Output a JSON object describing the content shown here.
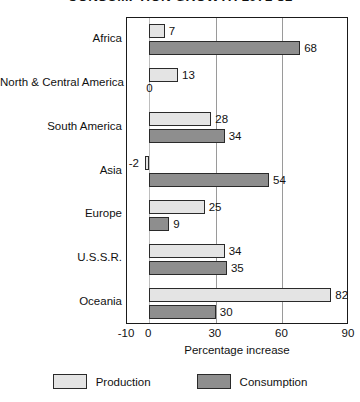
{
  "chart_data": {
    "type": "bar",
    "orientation": "horizontal",
    "title": "CONSUMPTION GROWTH 1971-81",
    "xlabel": "Percentage increase",
    "ylabel": "",
    "xlim": [
      -10,
      90
    ],
    "xticks": [
      -10,
      0,
      30,
      60,
      90
    ],
    "xticklabels": [
      "-10",
      "0",
      "30",
      "60",
      "90"
    ],
    "gridlines_x": [
      30,
      60
    ],
    "grid": true,
    "legend_position": "bottom",
    "categories": [
      "Africa",
      "North & Central America",
      "South America",
      "Asia",
      "Europe",
      "U.S.S.R.",
      "Oceania"
    ],
    "series": [
      {
        "name": "Production",
        "color": "#e4e4e4",
        "values": [
          7,
          13,
          28,
          -2,
          25,
          34,
          82
        ]
      },
      {
        "name": "Consumption",
        "color": "#8e8e8e",
        "values": [
          68,
          0,
          34,
          54,
          9,
          35,
          30
        ]
      }
    ],
    "value_labels": {
      "Africa": {
        "production": "7",
        "consumption": "68"
      },
      "North & Central America": {
        "production": "13",
        "consumption": "0"
      },
      "South America": {
        "production": "28",
        "consumption": "34"
      },
      "Asia": {
        "production": "-2",
        "consumption": "54"
      },
      "Europe": {
        "production": "25",
        "consumption": "9"
      },
      "U.S.S.R.": {
        "production": "34",
        "consumption": "35"
      },
      "Oceania": {
        "production": "82",
        "consumption": "30"
      }
    }
  },
  "legend": {
    "items": [
      {
        "label": "Production",
        "swatch": "production"
      },
      {
        "label": "Consumption",
        "swatch": "consumption"
      }
    ]
  }
}
